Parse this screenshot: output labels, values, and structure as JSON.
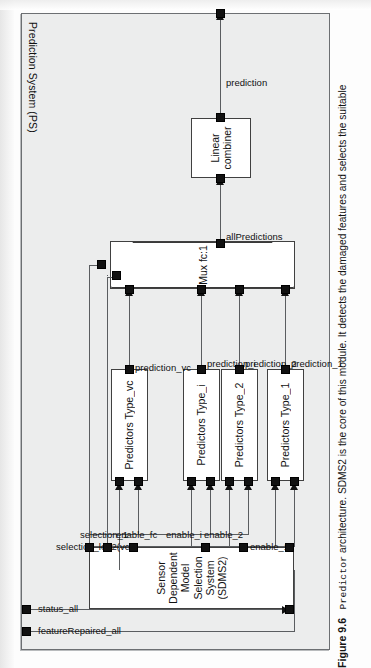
{
  "figure": {
    "number": "Figure 9.6",
    "caption_mono": "Predictor",
    "caption_rest": " architecture. SDMS2 is the core of this module. It detects the damaged features and selects the suitable"
  },
  "diagram": {
    "system_label": "Prediction System (PS)",
    "linear_combiner": "Linear\ncombiner",
    "mux": "Mux fc:1",
    "sdms": "Sensor Dependent Model Selection System (SDMS2)",
    "predictors": [
      {
        "label": "Predictors Type_1",
        "prediction": "prediction_1",
        "enable": "enable_1"
      },
      {
        "label": "Predictors Type_2",
        "prediction": "prediction_2",
        "enable": "enable_2"
      },
      {
        "label": "Predictors Type_i",
        "prediction": "prediction_i",
        "enable": "enable_i"
      },
      {
        "label": "Predictors Type_vc",
        "prediction": "prediction_vc",
        "enable": "enable_fc"
      }
    ],
    "signals": {
      "prediction_out": "prediction",
      "all_predictions": "allPredictions",
      "selection_1": "selection_1",
      "selection_log2": "selection_log2(vc)",
      "feature_repaired_all": "featureRepaired_all",
      "status_all": "status_all"
    },
    "colors": {
      "frame_fill": "#eceded",
      "frame_stroke": "#6c6f72",
      "block_fill": "#ffffff",
      "block_stroke": "#404040",
      "wire": "#5a5d60",
      "port": "#111111"
    }
  }
}
